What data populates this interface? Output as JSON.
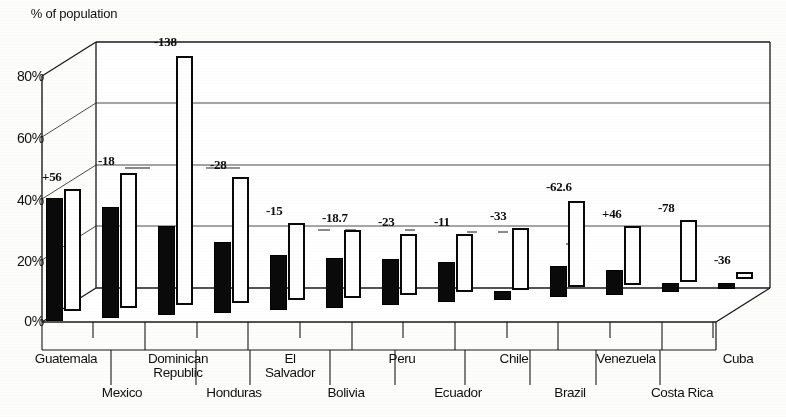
{
  "chart_data": {
    "type": "bar",
    "title": "",
    "ylabel": "% of population",
    "xlabel": "",
    "ylim": [
      0,
      80
    ],
    "yticks": [
      "0%",
      "20%",
      "40%",
      "60%",
      "80%"
    ],
    "ytick_values": [
      0,
      20,
      40,
      60,
      80
    ],
    "grid": true,
    "legend_position": "none",
    "style": "3d-grouped-bar",
    "categories": [
      "Guatemala",
      "Mexico",
      "Dominican\nRepublic",
      "Honduras",
      "El\nSalvador",
      "Bolivia",
      "Peru",
      "Ecuador",
      "Chile",
      "Brazil",
      "Venezuela",
      "Costa Rica",
      "Cuba"
    ],
    "series": [
      {
        "name": "black-bar",
        "values": [
          40,
          36,
          29,
          23,
          18,
          16,
          15,
          13,
          3,
          10,
          8,
          3,
          2
        ]
      },
      {
        "name": "white-bar",
        "values": [
          39.5,
          44,
          81,
          41,
          25,
          22,
          20,
          19,
          20,
          28,
          19,
          20,
          2.5
        ]
      }
    ],
    "annotations": [
      "+56",
      "-18",
      "-138",
      "-28",
      "-15",
      "-18.7",
      "-23",
      "-11",
      "-33",
      "-62.6",
      "+46",
      "-78",
      "-36"
    ]
  }
}
